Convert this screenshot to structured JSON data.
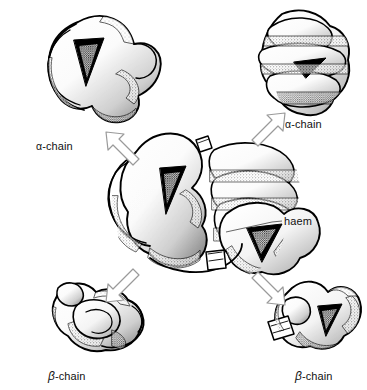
{
  "figure": {
    "background_color": "#ffffff",
    "ink_color": "#000000",
    "arrow_outline_color": "#9a9a9a",
    "leader_line_color": "#555555",
    "width": 367,
    "height": 390
  },
  "labels": {
    "alpha_top_left": {
      "greek": "α",
      "rest": "-chain"
    },
    "alpha_top_right": {
      "greek": "α",
      "rest": "-chain"
    },
    "beta_bottom_left": {
      "greek": "β",
      "rest": "-chain"
    },
    "beta_bottom_right": {
      "greek": "β",
      "rest": "-chain"
    },
    "haem": "haem"
  },
  "subunits": [
    {
      "name": "alpha-chain-top-left",
      "label": "α-chain",
      "position": "top-left"
    },
    {
      "name": "alpha-chain-top-right",
      "label": "α-chain",
      "position": "top-right"
    },
    {
      "name": "beta-chain-bottom-left",
      "label": "β-chain",
      "position": "bottom-left"
    },
    {
      "name": "beta-chain-bottom-right",
      "label": "β-chain",
      "position": "bottom-right"
    }
  ],
  "arrows": [
    {
      "name": "arrow-to-alpha-top-left",
      "direction": "up-left",
      "style": "hollow-outline"
    },
    {
      "name": "arrow-to-alpha-top-right",
      "direction": "up-right",
      "style": "hollow-outline"
    },
    {
      "name": "arrow-to-beta-bottom-left",
      "direction": "down-left",
      "style": "hollow-outline"
    },
    {
      "name": "arrow-to-beta-bottom-right",
      "direction": "down-right",
      "style": "hollow-outline"
    }
  ],
  "callouts": [
    {
      "name": "haem-callout",
      "text": "haem",
      "leader": "from haem pocket in lower-right subunit to label"
    }
  ]
}
